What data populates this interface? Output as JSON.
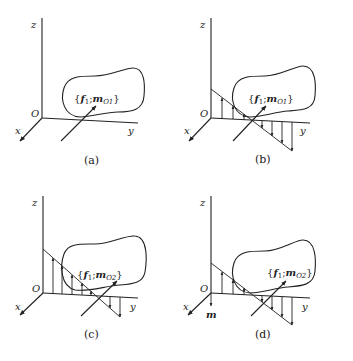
{
  "panels": [
    {
      "id": "a",
      "caption": "(a)",
      "axes": {
        "z": "z",
        "y": "y",
        "x": "x",
        "origin": "O"
      },
      "load": {
        "open": "{",
        "f": "f",
        "f_sub": "1",
        "sep": ";",
        "m": "m",
        "m_sub": "O1",
        "close": "}"
      },
      "distribution": "none"
    },
    {
      "id": "b",
      "caption": "(b)",
      "axes": {
        "z": "z",
        "y": "y",
        "x": "x",
        "origin": "O"
      },
      "load": {
        "open": "{",
        "f": "f",
        "f_sub": "1",
        "sep": ";",
        "m": "m",
        "m_sub": "O1",
        "close": "}"
      },
      "distribution": "linear, positive near O, negative beyond"
    },
    {
      "id": "c",
      "caption": "(c)",
      "axes": {
        "z": "z",
        "y": "y",
        "x": "x",
        "origin": "O"
      },
      "load": {
        "open": "{",
        "f": "f",
        "f_sub": "1",
        "sep": ";",
        "m": "m",
        "m_sub": "O2",
        "close": "}"
      },
      "distribution": "linear, larger positive near O, small negative beyond"
    },
    {
      "id": "d",
      "caption": "(d)",
      "axes": {
        "z": "z",
        "y": "y",
        "x": "x",
        "origin": "O"
      },
      "load": {
        "open": "{",
        "f": "f",
        "f_sub": "1",
        "sep": ";",
        "m": "m",
        "m_sub": "O2",
        "close": "}"
      },
      "moment_label": "m",
      "distribution": "linear, positive near O, negative beyond"
    }
  ]
}
